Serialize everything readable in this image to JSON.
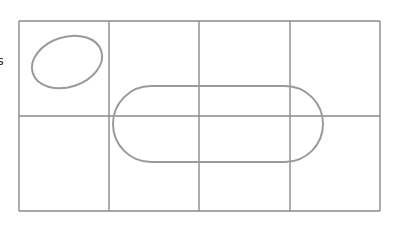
{
  "diagram": {
    "type": "karnaugh-map-sketch",
    "style": "pencil",
    "stroke_color": "#8a8a8a",
    "loop_color": "#9a9a9a",
    "edge_label": "s",
    "grid": {
      "rows": 2,
      "cols": 4,
      "x": [
        19,
        109,
        199,
        290,
        380
      ],
      "y": [
        21,
        116,
        211
      ]
    },
    "groupings": [
      {
        "name": "single-cell-loop",
        "cells": [
          [
            0,
            0
          ]
        ],
        "shape": "ellipse",
        "cx": 67,
        "cy": 62,
        "rx": 36,
        "ry": 25,
        "rotate": -18
      },
      {
        "name": "four-cell-loop",
        "cells": [
          [
            0,
            1
          ],
          [
            0,
            2
          ],
          [
            0,
            3
          ],
          [
            1,
            1
          ],
          [
            1,
            2
          ],
          [
            1,
            3
          ]
        ],
        "shape": "rounded-rect",
        "x": 113,
        "y": 86,
        "w": 210,
        "h": 76,
        "r": 38
      }
    ]
  }
}
